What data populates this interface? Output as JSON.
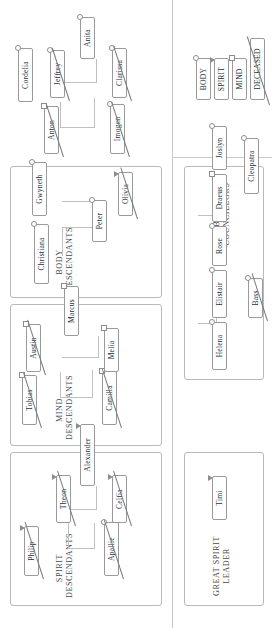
{
  "diagram": {
    "orientation": "rotated-90",
    "panels": [
      {
        "id": "spirit-descendants",
        "title": "SPIRIT\nDESCENDANTS"
      },
      {
        "id": "mind-descendants",
        "title": "MIND\nDESCENDANTS"
      },
      {
        "id": "body-descendants",
        "title": "BODY\nDESCENDANTS"
      },
      {
        "id": "great-spirit-leader",
        "title": "GREAT SPIRIT\nLEADER"
      },
      {
        "id": "body-councillors",
        "title": "BODY\nCOUNCILLORS"
      }
    ],
    "nodes": {
      "philip": {
        "label": "Philip",
        "type": "spirit",
        "deceased": true
      },
      "apallie": {
        "label": "Apallie",
        "type": "body",
        "deceased": true
      },
      "theon": {
        "label": "Theon",
        "type": "spirit",
        "deceased": true
      },
      "celfia": {
        "label": "Celfia",
        "type": "spirit",
        "deceased": true
      },
      "alexander": {
        "label": "Alexander",
        "type": "spirit",
        "deceased": false
      },
      "camilla": {
        "label": "Camilla",
        "type": "mind",
        "deceased": true
      },
      "tobias": {
        "label": "Tobias",
        "type": "mind",
        "deceased": true
      },
      "melia": {
        "label": "Melia",
        "type": "mind",
        "deceased": false
      },
      "austin": {
        "label": "Austin",
        "type": "mind",
        "deceased": true
      },
      "marcus": {
        "label": "Marcus",
        "type": "mind",
        "deceased": false
      },
      "christiana": {
        "label": "Christiana",
        "type": "body",
        "deceased": false
      },
      "peter": {
        "label": "Peter",
        "type": "body",
        "deceased": false
      },
      "olivia": {
        "label": "Olivia",
        "type": "body",
        "deceased": true
      },
      "gwyneth": {
        "label": "Gwyneth",
        "type": "body",
        "deceased": false
      },
      "imogen": {
        "label": "Imogen",
        "type": "body",
        "deceased": true
      },
      "anton": {
        "label": "Anton",
        "type": "mind",
        "deceased": true
      },
      "cordelia": {
        "label": "Cordelia",
        "type": "body",
        "deceased": false
      },
      "clarissa": {
        "label": "Clarissa",
        "type": "body",
        "deceased": true
      },
      "jeffrey": {
        "label": "Jeffrey",
        "type": "body",
        "deceased": true
      },
      "anita": {
        "label": "Anita",
        "type": "body",
        "deceased": false
      },
      "timi": {
        "label": "Timi",
        "type": "spirit",
        "deceased": false
      },
      "helena": {
        "label": "Helena",
        "type": "body",
        "deceased": false
      },
      "elistair": {
        "label": "Elistair",
        "type": "body",
        "deceased": false
      },
      "bass": {
        "label": "Bass",
        "type": "body",
        "deceased": true
      },
      "rose": {
        "label": "Rose",
        "type": "body",
        "deceased": false
      },
      "draeus": {
        "label": "Draeus",
        "type": "mind",
        "deceased": false
      },
      "joslyn": {
        "label": "Joslyn",
        "type": "body",
        "deceased": false
      },
      "cleopatra": {
        "label": "Cleopatra",
        "type": "body",
        "deceased": false
      }
    },
    "legend": [
      {
        "id": "legend-body",
        "label": "BODY",
        "type": "body",
        "deceased": false
      },
      {
        "id": "legend-spirit",
        "label": "SPIRIT",
        "type": "spirit",
        "deceased": false
      },
      {
        "id": "legend-mind",
        "label": "MIND",
        "type": "mind",
        "deceased": false
      },
      {
        "id": "legend-deceased",
        "label": "DECEASED",
        "type": "none",
        "deceased": true
      }
    ],
    "colors": {
      "panel_border": "#b9b9b9",
      "node_border": "#9a9a9a",
      "link": "#c0c0c0",
      "title_text": "#4a4a4a",
      "node_text": "#2d2d2d",
      "marker": "#8d8d8d",
      "background": "#ffffff"
    }
  }
}
